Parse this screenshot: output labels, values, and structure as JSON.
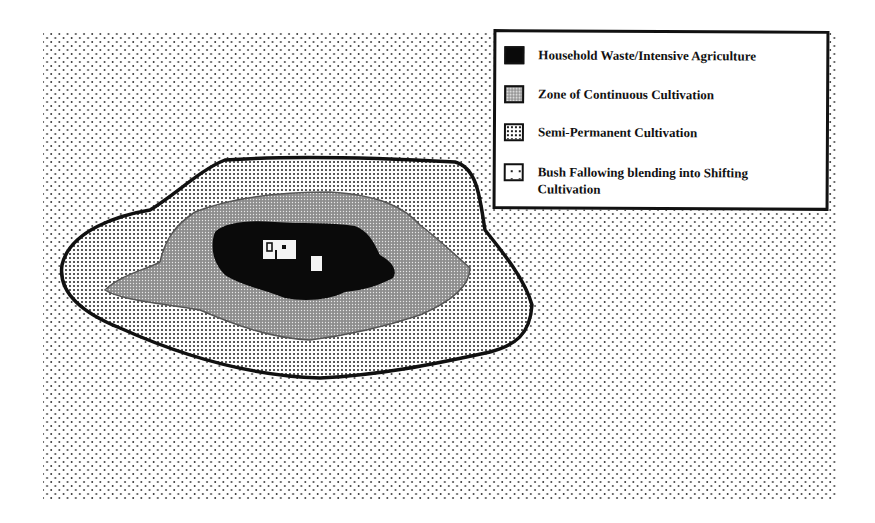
{
  "figure": {
    "type": "concentric land-use zone diagram",
    "zones_from_center": [
      "Household Waste/Intensive Agriculture",
      "Zone of Continuous Cultivation",
      "Semi-Permanent Cultivation",
      "Bush Fallowing blending into Shifting Cultivation"
    ]
  },
  "legend": {
    "items": [
      {
        "label": "Household Waste/Intensive Agriculture",
        "pattern": "solid-black",
        "color": "#0a0a0a"
      },
      {
        "label": "Zone of Continuous Cultivation",
        "pattern": "dense-stipple",
        "color": "#9a9a9a"
      },
      {
        "label": "Semi-Permanent Cultivation",
        "pattern": "medium-dots",
        "color": "#ffffff"
      },
      {
        "label": "Bush Fallowing blending into Shifting Cultivation",
        "pattern": "sparse-dots",
        "color": "#ffffff"
      }
    ]
  },
  "colors": {
    "ink": "#111111",
    "background": "#ffffff",
    "continuous_zone": "#9a9a9a"
  }
}
